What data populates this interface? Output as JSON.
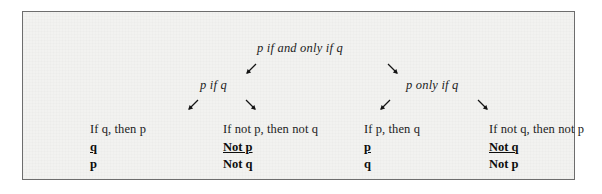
{
  "figure": {
    "background_color": "#f2f2f0",
    "border_color": "#6d6d6d",
    "text_color": "#1c1c1c"
  },
  "tree": {
    "root": {
      "label": "p if and only if q"
    },
    "branches": [
      {
        "label": "p if q"
      },
      {
        "label": "p only if q"
      }
    ],
    "arrows": {
      "down_left": "↙",
      "down_right": "↘"
    },
    "leaves": [
      {
        "title": "If q, then p",
        "premise": "q",
        "conclusion": "p"
      },
      {
        "title": "If not p, then not q",
        "premise": "Not p",
        "conclusion": "Not q"
      },
      {
        "title": "If p, then q",
        "premise": "p",
        "conclusion": "q"
      },
      {
        "title": "If not q, then not p",
        "premise": "Not q",
        "conclusion": "Not p"
      }
    ]
  }
}
